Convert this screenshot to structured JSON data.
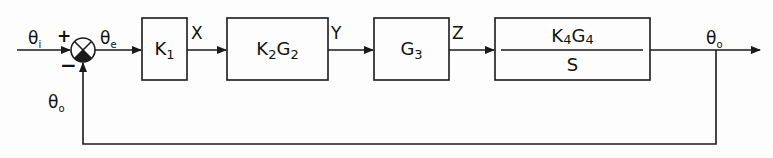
{
  "diagram": {
    "type": "block-diagram",
    "signals": {
      "input": {
        "sym": "θ",
        "sub": "i"
      },
      "error": {
        "sym": "θ",
        "sub": "e"
      },
      "x": "X",
      "y": "Y",
      "z": "Z",
      "output": {
        "sym": "θ",
        "sub": "o"
      },
      "feedback": {
        "sym": "θ",
        "sub": "o"
      }
    },
    "summing_junction": {
      "plus": "+",
      "minus": "−"
    },
    "blocks": [
      {
        "id": "k1",
        "label": {
          "main": "K",
          "sub": "1"
        }
      },
      {
        "id": "k2g2",
        "label": {
          "k": "K",
          "ksub": "2",
          "g": "G",
          "gsub": "2"
        }
      },
      {
        "id": "g3",
        "label": {
          "g": "G",
          "gsub": "3"
        }
      },
      {
        "id": "k4g4s",
        "numerator": {
          "k": "K",
          "ksub": "4",
          "g": "G",
          "gsub": "4"
        },
        "denominator": "S"
      }
    ],
    "stroke_color": "#1a1a1a",
    "background_color": "#fdfdfd"
  }
}
